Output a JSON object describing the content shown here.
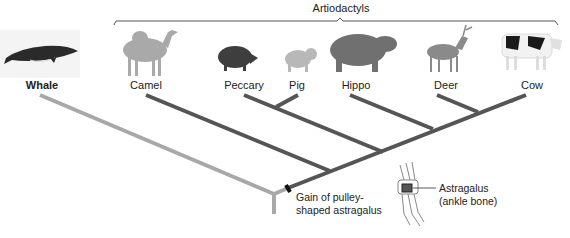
{
  "bracket": {
    "label": "Artiodactyls"
  },
  "taxa": [
    {
      "id": "whale",
      "label": "Whale",
      "bold": true
    },
    {
      "id": "camel",
      "label": "Camel"
    },
    {
      "id": "peccary",
      "label": "Peccary"
    },
    {
      "id": "pig",
      "label": "Pig"
    },
    {
      "id": "hippo",
      "label": "Hippo"
    },
    {
      "id": "deer",
      "label": "Deer"
    },
    {
      "id": "cow",
      "label": "Cow"
    }
  ],
  "annotations": {
    "gain_line1": "Gain of pulley-",
    "gain_line2": "shaped astragalus",
    "astragalus_line1": "Astragalus",
    "astragalus_line2": "(ankle bone)"
  },
  "colors": {
    "outgroup_branch": "#a8a8a8",
    "ingroup_branch": "#555555",
    "trait_marker": "#111111"
  }
}
